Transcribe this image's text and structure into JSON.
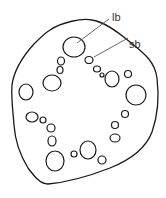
{
  "labels": {
    "lb": "lb",
    "sb": "sb"
  },
  "colors": {
    "stroke": "#1a1a1a",
    "background": "#ffffff"
  }
}
